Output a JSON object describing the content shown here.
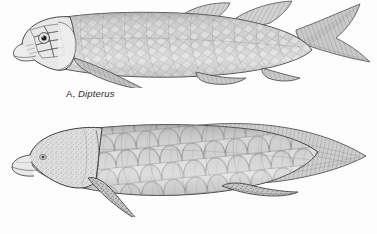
{
  "figure": {
    "background_color": "#fdfdfd",
    "ink_color": "#3a3a3a",
    "scale_fill_light": "#e4e4e4",
    "scale_fill_mid": "#c9c9c9",
    "scale_fill_dark": "#a8a8a8",
    "medium": "line-and-stipple pen drawing, grayscale"
  },
  "panels": [
    {
      "id": "A",
      "letter": "A,",
      "taxon": "Dipterus",
      "caption_full": "A, Dipterus",
      "group": "fossil lungfish",
      "scale_type": "rhomboid overlapping scales in diagonal rows",
      "tail_type": "heterocercal",
      "dorsal_fin_count": 2,
      "eye": "large, dark, ringed",
      "head": "armored with distinct cranial bone plates",
      "pectoral_fin": "elongate lobed fin",
      "pelvic_fin": "small ventral lobed fin"
    },
    {
      "id": "B",
      "letter": "B,",
      "taxon": "Epiceratodus",
      "caption_full": "B, Epiceratodus",
      "group": "modern Australian lungfish",
      "scale_type": "large rounded cycloid scales",
      "tail_type": "diphycercal, pointed",
      "dorsal_fin_count": 1,
      "eye": "small, faint",
      "head": "smooth, stippled, unarmored",
      "pectoral_fin": "pointed paddle-like lobe fin",
      "pelvic_fin": "pointed paddle-like lobe fin"
    }
  ]
}
